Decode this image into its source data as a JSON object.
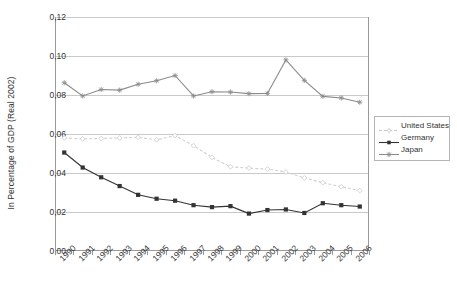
{
  "chart_data": {
    "type": "line",
    "title": "",
    "xlabel": "",
    "ylabel": "In Percentage of GDP (Real 2002)",
    "ylim": [
      0.0,
      0.12
    ],
    "ytick_labels": [
      "0,12",
      "0,10",
      "0,08",
      "0,06",
      "0,04",
      "0,02",
      "0,00"
    ],
    "ytick_values": [
      0.12,
      0.1,
      0.08,
      0.06,
      0.04,
      0.02,
      0.0
    ],
    "grid": true,
    "legend_position": "right",
    "categories": [
      "1990",
      "1991",
      "1992",
      "1993",
      "1994",
      "1995",
      "1996",
      "1997",
      "1998",
      "1999",
      "2000",
      "2001",
      "2002",
      "2003",
      "2004",
      "2005",
      "2006"
    ],
    "series": [
      {
        "name": "United States",
        "color": "#d0d0d0",
        "marker": "diamond",
        "dash": "3,2",
        "values": [
          0.058,
          0.0575,
          0.0577,
          0.058,
          0.0583,
          0.057,
          0.0592,
          0.054,
          0.048,
          0.0432,
          0.0425,
          0.042,
          0.0405,
          0.0375,
          0.035,
          0.033,
          0.031
        ]
      },
      {
        "name": "Germany",
        "color": "#333333",
        "marker": "square",
        "dash": "",
        "values": [
          0.0505,
          0.0428,
          0.0378,
          0.0333,
          0.0288,
          0.0268,
          0.0258,
          0.0235,
          0.0225,
          0.023,
          0.0192,
          0.021,
          0.0213,
          0.0195,
          0.0245,
          0.0235,
          0.0228
        ]
      },
      {
        "name": "Japan",
        "color": "#8a8a8a",
        "marker": "asterisk",
        "dash": "",
        "values": [
          0.0863,
          0.0795,
          0.0828,
          0.0825,
          0.0855,
          0.0873,
          0.09,
          0.0795,
          0.0817,
          0.0815,
          0.0807,
          0.0808,
          0.098,
          0.0875,
          0.0793,
          0.0785,
          0.0763
        ]
      }
    ]
  },
  "legend": {
    "items": [
      {
        "label": "United States"
      },
      {
        "label": "Germany"
      },
      {
        "label": "Japan"
      }
    ]
  }
}
